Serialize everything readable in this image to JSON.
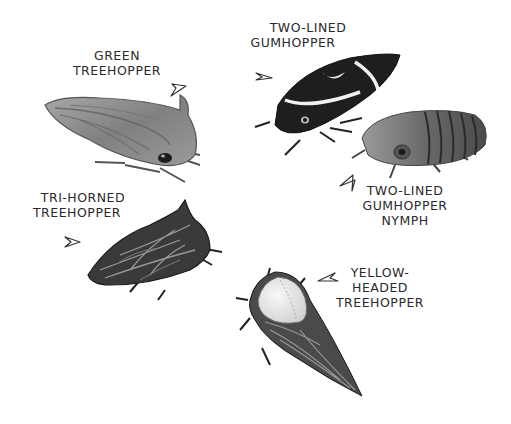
{
  "illustration": {
    "style": "grayscale hand-drawn insect illustration",
    "background": "#ffffff",
    "ink": "#2a2a2a"
  },
  "insects": [
    {
      "id": "green-treehopper",
      "label_lines": [
        "GREEN",
        "TREEHOPPER"
      ],
      "arrow_direction": "down-right",
      "body_tone": "#8a8a8a"
    },
    {
      "id": "two-lined-gumhopper",
      "label_lines": [
        "TWO-LINED",
        "GUMHOPPER"
      ],
      "arrow_direction": "down-right",
      "body_tone": "#1e1e1e",
      "stripe_tone": "#f2f2f2"
    },
    {
      "id": "two-lined-gumhopper-nymph",
      "label_lines": [
        "TWO-LINED",
        "GUMHOPPER",
        "NYMPH"
      ],
      "arrow_direction": "up-left",
      "body_tone": "#6e6e6e"
    },
    {
      "id": "tri-horned-treehopper",
      "label_lines": [
        "TRI-HORNED",
        "TREEHOPPER"
      ],
      "arrow_direction": "right",
      "body_tone": "#3a3a3a"
    },
    {
      "id": "yellow-headed-treehopper",
      "label_lines": [
        "YELLOW-",
        "HEADED",
        "TREEHOPPER"
      ],
      "arrow_direction": "left",
      "body_tone": "#4a4a4a",
      "head_tone": "#e6e6e6"
    }
  ]
}
